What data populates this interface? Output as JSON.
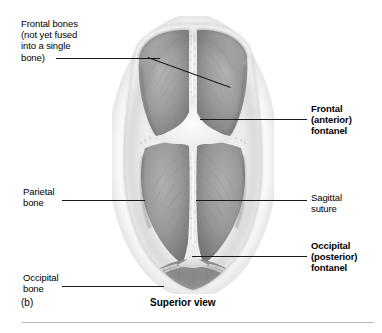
{
  "figure": {
    "panel_letter": "(b)",
    "caption": "Superior view",
    "view_type": "anatomical-photograph"
  },
  "labels": [
    {
      "id": "frontal-bones",
      "text": "Frontal bones\n(not yet fused\ninto a single\nbone)",
      "bold": false,
      "side": "left"
    },
    {
      "id": "parietal-bone",
      "text": "Parietal\nbone",
      "bold": false,
      "side": "left"
    },
    {
      "id": "occipital-bone",
      "text": "Occipital\nbone",
      "bold": false,
      "side": "left"
    },
    {
      "id": "frontal-fontanel",
      "text": "Frontal\n(anterior)\nfontanel",
      "bold": true,
      "side": "right"
    },
    {
      "id": "sagittal-suture",
      "text": "Sagittal\nsuture",
      "bold": false,
      "side": "right"
    },
    {
      "id": "occipital-fontanel",
      "text": "Occipital\n(posterior)\nfontanel",
      "bold": true,
      "side": "right"
    }
  ],
  "colors": {
    "background": "#ffffff",
    "bone_mid": "#9b9b9b",
    "bone_dark": "#7c7c7c",
    "bone_light": "#bdbdbd",
    "fontanel": "#f1f1f1",
    "suture": "#e2e2e2",
    "leader_line": "#1a1a1a",
    "rule": "#b9b9b9",
    "text": "#000000"
  }
}
